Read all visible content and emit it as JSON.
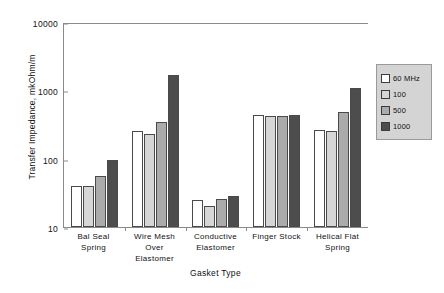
{
  "chart_data": {
    "type": "bar",
    "title": "",
    "xlabel": "Gasket Type",
    "ylabel": "Transfer Impedance, mkOhm/m",
    "yscale": "log",
    "ylim": [
      10,
      10000
    ],
    "yticks": [
      "10000",
      "1000",
      "100",
      "10"
    ],
    "grid": false,
    "legend_position": "right",
    "categories": [
      "Bal Seal Spring",
      "Wire Mesh Over Elastomer",
      "Conductive Elastomer",
      "Finger Stock",
      "Helical Flat Spring"
    ],
    "category_lines": [
      [
        "Bal Seal",
        "Spring"
      ],
      [
        "Wire Mesh",
        "Over",
        "Elastomer"
      ],
      [
        "Conductive",
        "Elastomer"
      ],
      [
        "Finger Stock"
      ],
      [
        "Helical Flat",
        "Spring"
      ]
    ],
    "series": [
      {
        "name": "60 MHz",
        "color": "#ffffff",
        "values": [
          40,
          250,
          25,
          440,
          260
        ]
      },
      {
        "name": "100",
        "color": "#d6d6d6",
        "values": [
          40,
          230,
          20,
          420,
          250
        ]
      },
      {
        "name": "500",
        "color": "#ababab",
        "values": [
          55,
          350,
          26,
          420,
          480
        ]
      },
      {
        "name": "1000",
        "color": "#4d4d4d",
        "values": [
          95,
          1700,
          28,
          440,
          1100
        ]
      }
    ]
  },
  "legend": {
    "items": [
      {
        "label": "60 MHz",
        "swatch": "#ffffff"
      },
      {
        "label": "100",
        "swatch": "#d6d6d6"
      },
      {
        "label": "500",
        "swatch": "#ababab"
      },
      {
        "label": "1000",
        "swatch": "#4d4d4d"
      }
    ]
  },
  "axes": {
    "y_title": "Transfer Impedance, mkOhm/m",
    "x_title": "Gasket Type",
    "y_ticks": [
      "10000",
      "1000",
      "100",
      "10"
    ]
  }
}
